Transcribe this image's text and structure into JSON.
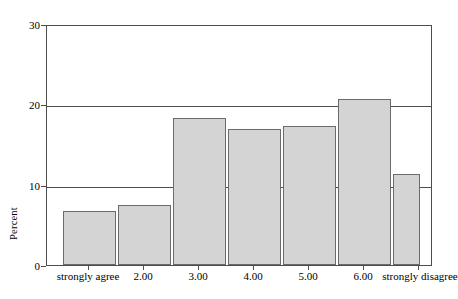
{
  "chart_data": {
    "type": "bar",
    "title": "",
    "subtitle": "",
    "xlabel": "",
    "ylabel": "Percent",
    "categories": [
      "strongly agree",
      "2.00",
      "3.00",
      "4.00",
      "5.00",
      "6.00",
      "strongly disagree"
    ],
    "values": [
      6.8,
      7.5,
      18.4,
      17.1,
      17.4,
      20.9,
      11.4
    ],
    "series": [
      {
        "name": "Percent",
        "values": [
          6.8,
          7.5,
          18.4,
          17.1,
          17.4,
          20.9,
          11.4
        ]
      }
    ],
    "ylim": [
      0,
      30
    ],
    "yticks": [
      0,
      10,
      20,
      30
    ],
    "ytick_labels": [
      "0",
      "10",
      "20",
      "30"
    ],
    "xlim_note": "categorical",
    "grid": "horizontal gridlines at 10, 20",
    "legend": "none",
    "legend_position": "none",
    "bar_fill_color": "#d4d4d4",
    "bar_edge_color": "#6b6b6b",
    "axis_color": "#4d4d4d",
    "background_color": "#ffffff"
  },
  "axes": {
    "y_title": "Percent",
    "y_ticks": [
      {
        "label": "30",
        "value": 30
      },
      {
        "label": "20",
        "value": 20
      },
      {
        "label": "10",
        "value": 10
      },
      {
        "label": "0",
        "value": 0
      }
    ],
    "x_ticks": [
      {
        "label": "strongly agree"
      },
      {
        "label": "2.00"
      },
      {
        "label": "3.00"
      },
      {
        "label": "4.00"
      },
      {
        "label": "5.00"
      },
      {
        "label": "6.00"
      },
      {
        "label": "strongly disagree"
      }
    ]
  },
  "bars": [
    {
      "category": "strongly agree",
      "value": 6.8
    },
    {
      "category": "2.00",
      "value": 7.5
    },
    {
      "category": "3.00",
      "value": 18.4
    },
    {
      "category": "4.00",
      "value": 17.1
    },
    {
      "category": "5.00",
      "value": 17.4
    },
    {
      "category": "6.00",
      "value": 20.9
    },
    {
      "category": "strongly disagree",
      "value": 11.4
    }
  ]
}
